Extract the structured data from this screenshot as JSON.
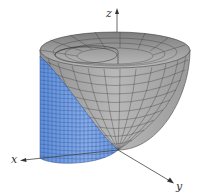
{
  "figure": {
    "axes": {
      "x_label": "x",
      "y_label": "y",
      "z_label": "z"
    },
    "surfaces": [
      {
        "name": "paraboloid",
        "color": "#a6a6a6",
        "mesh_color": "#3a3a3a"
      },
      {
        "name": "cylinder",
        "color": "#7aa3e0",
        "mesh_color": "#2c4f93"
      }
    ],
    "axis_color": "#444444",
    "background": "#ffffff"
  }
}
